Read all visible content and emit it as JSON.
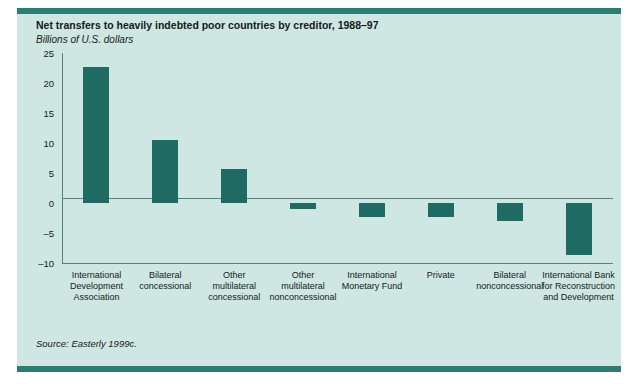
{
  "figure": {
    "header_fragment": "",
    "source_note": "Source: Easterly 1999c.",
    "panel_bg": "#cfe7e3",
    "rule_color": "#2e7d74",
    "bar_color": "#1f6b63",
    "axis_color": "#5c7d7a"
  },
  "chart_data": {
    "type": "bar",
    "title": "Net transfers to heavily indebted poor countries by creditor, 1988–97",
    "subtitle": "Billions of U.S. dollars",
    "xlabel": "",
    "ylabel": "Billions of U.S. dollars",
    "ylim": [
      -10,
      25
    ],
    "yticks": [
      25,
      20,
      15,
      10,
      5,
      0,
      -5,
      -10
    ],
    "ytick_labels": [
      "25",
      "20",
      "15",
      "10",
      "5",
      "0",
      "–5",
      "–10"
    ],
    "grid": false,
    "legend": false,
    "zero_line": 0,
    "categories": [
      "International Development Association",
      "Bilateral concessional",
      "Other multilateral concessional",
      "Other multilateral nonconcessional",
      "International Monetary Fund",
      "Private",
      "Bilateral nonconcessional",
      "International Bank for Reconstruction and Development"
    ],
    "category_lines": [
      [
        "International",
        "Development",
        "Association"
      ],
      [
        "Bilateral",
        "concessional"
      ],
      [
        "Other",
        "multilateral",
        "concessional"
      ],
      [
        "Other",
        "multilateral",
        "nonconcessional"
      ],
      [
        "International",
        "Monetary Fund"
      ],
      [
        "Private"
      ],
      [
        "Bilateral",
        "nonconcessional"
      ],
      [
        "International Bank",
        "for Reconstruction",
        "and Development"
      ]
    ],
    "values": [
      22.6,
      10.5,
      5.7,
      -1.0,
      -2.3,
      -2.3,
      -3.0,
      -8.7
    ]
  }
}
